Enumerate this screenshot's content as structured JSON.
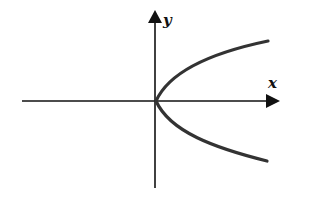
{
  "figure": {
    "axes": {
      "x_label": "x",
      "y_label": "y"
    },
    "curve": {
      "type": "parabola",
      "opens": "right",
      "vertex": "origin"
    },
    "colors": {
      "line": "#111111",
      "curve": "#333333",
      "background": "#ffffff"
    }
  }
}
